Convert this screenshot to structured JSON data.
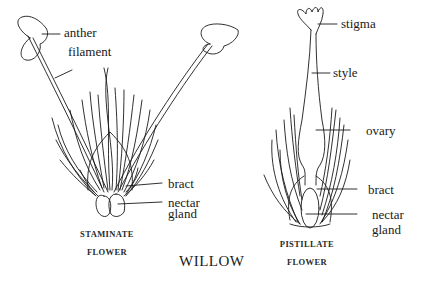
{
  "title": "WILLOW",
  "staminate": {
    "caption_line1": "STAMINATE",
    "caption_line2": "FLOWER",
    "labels": {
      "anther": "anther",
      "filament": "filament",
      "bract": "bract",
      "nectar_line1": "nectar",
      "nectar_line2": "gland"
    }
  },
  "pistillate": {
    "caption_line1": "PISTILLATE",
    "caption_line2": "FLOWER",
    "labels": {
      "stigma": "stigma",
      "style": "style",
      "ovary": "ovary",
      "bract": "bract",
      "nectar_line1": "nectar",
      "nectar_line2": "gland"
    }
  },
  "colors": {
    "ink": "#1a1a1a",
    "background": "#ffffff"
  }
}
